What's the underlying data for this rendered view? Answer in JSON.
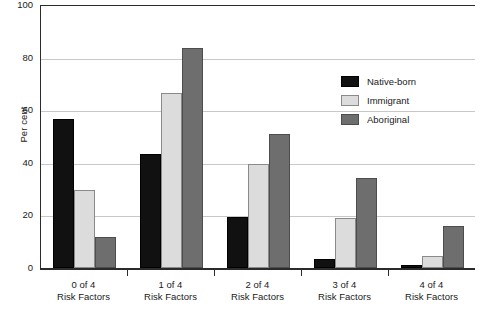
{
  "chart_data": {
    "type": "bar",
    "title": "",
    "xlabel": "",
    "ylabel": "Per cent",
    "ylim": [
      0,
      100
    ],
    "yticks": [
      0,
      20,
      40,
      60,
      80,
      100
    ],
    "ytick_labels": [
      "0",
      "20",
      "40",
      "60",
      "80",
      "100"
    ],
    "grid": "horizontal",
    "legend_position": "upper-right-inside",
    "categories": [
      "0 of 4 Risk Factors",
      "1 of 4 Risk Factors",
      "2 of 4 Risk Factors",
      "3 of 4 Risk Factors",
      "4 of 4 Risk Factors"
    ],
    "category_lines": [
      {
        "line1": "0 of 4",
        "line2": "Risk Factors"
      },
      {
        "line1": "1 of 4",
        "line2": "Risk Factors"
      },
      {
        "line1": "2 of 4",
        "line2": "Risk Factors"
      },
      {
        "line1": "3 of 4",
        "line2": "Risk Factors"
      },
      {
        "line1": "4 of 4",
        "line2": "Risk Factors"
      }
    ],
    "series": [
      {
        "name": "Native-born",
        "color": "#111111",
        "values": [
          56.7,
          43.5,
          19.4,
          3.4,
          1.0
        ]
      },
      {
        "name": "Immigrant",
        "color": "#dcdcdc",
        "values": [
          29.7,
          66.5,
          39.5,
          19.0,
          4.5
        ]
      },
      {
        "name": "Aboriginal",
        "color": "#6e6e6e",
        "values": [
          11.8,
          83.6,
          51.0,
          34.2,
          16.0
        ]
      }
    ]
  },
  "legend": {
    "items": [
      {
        "label": "Native-born"
      },
      {
        "label": "Immigrant"
      },
      {
        "label": "Aboriginal"
      }
    ]
  },
  "axes": {
    "y_title": "Per cent"
  }
}
